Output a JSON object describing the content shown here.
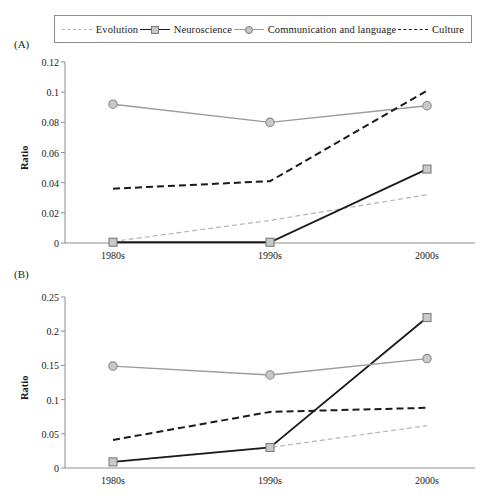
{
  "figure": {
    "legend_items": [
      {
        "label": "Evolution",
        "style": "dashed-light",
        "marker": "none",
        "color": "#b4b4b4"
      },
      {
        "label": "Neuroscience",
        "style": "solid-dark",
        "marker": "square",
        "color": "#1a1a1a"
      },
      {
        "label": "Communication and language",
        "style": "solid-gray",
        "marker": "circle",
        "color": "#9a9a9a"
      },
      {
        "label": "Culture",
        "style": "dashed-dark",
        "marker": "none",
        "color": "#1a1a1a"
      }
    ],
    "panels": [
      {
        "tag": "(A)"
      },
      {
        "tag": "(B)"
      }
    ]
  },
  "chart_data": [
    {
      "type": "line",
      "panel": "(A)",
      "title": "",
      "xlabel": "",
      "ylabel": "Ratio",
      "categories": [
        "1980s",
        "1990s",
        "2000s"
      ],
      "ylim": [
        0,
        0.12
      ],
      "yticks": [
        "0",
        "0.02",
        "0.04",
        "0.06",
        "0.08",
        "0.1",
        "0.12"
      ],
      "ytick_values": [
        0,
        0.02,
        0.04,
        0.06,
        0.08,
        0.1,
        0.12
      ],
      "grid": false,
      "legend_position": "top",
      "series": [
        {
          "name": "Evolution",
          "values": [
            0.001,
            0.015,
            0.032
          ],
          "style": "dashed-light",
          "marker": "none",
          "color": "#b4b4b4"
        },
        {
          "name": "Neuroscience",
          "values": [
            0.0005,
            0.0005,
            0.049
          ],
          "style": "solid-dark",
          "marker": "square",
          "color": "#1a1a1a"
        },
        {
          "name": "Communication and language",
          "values": [
            0.092,
            0.08,
            0.091
          ],
          "style": "solid-gray",
          "marker": "circle",
          "color": "#9a9a9a"
        },
        {
          "name": "Culture",
          "values": [
            0.036,
            0.041,
            0.101
          ],
          "style": "dashed-dark",
          "marker": "none",
          "color": "#1a1a1a"
        }
      ]
    },
    {
      "type": "line",
      "panel": "(B)",
      "title": "",
      "xlabel": "",
      "ylabel": "Ratio",
      "categories": [
        "1980s",
        "1990s",
        "2000s"
      ],
      "ylim": [
        0,
        0.25
      ],
      "yticks": [
        "0",
        "0.05",
        "0.1",
        "0.15",
        "0.2",
        "0.25"
      ],
      "ytick_values": [
        0,
        0.05,
        0.1,
        0.15,
        0.2,
        0.25
      ],
      "grid": false,
      "legend_position": "top",
      "series": [
        {
          "name": "Evolution",
          "values": [
            0.008,
            0.03,
            0.062
          ],
          "style": "dashed-light",
          "marker": "none",
          "color": "#b4b4b4"
        },
        {
          "name": "Neuroscience",
          "values": [
            0.009,
            0.03,
            0.22
          ],
          "style": "solid-dark",
          "marker": "square",
          "color": "#1a1a1a"
        },
        {
          "name": "Communication and language",
          "values": [
            0.149,
            0.136,
            0.16
          ],
          "style": "solid-gray",
          "marker": "circle",
          "color": "#9a9a9a"
        },
        {
          "name": "Culture",
          "values": [
            0.041,
            0.082,
            0.088
          ],
          "style": "dashed-dark",
          "marker": "none",
          "color": "#1a1a1a"
        }
      ]
    }
  ]
}
